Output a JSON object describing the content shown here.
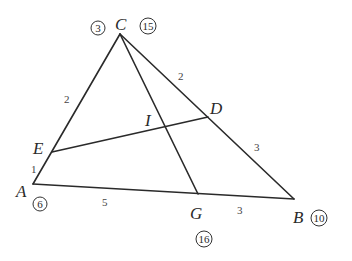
{
  "diagram": {
    "type": "geometry-triangle",
    "points": {
      "A": {
        "label": "A",
        "x": 33,
        "y": 184
      },
      "B": {
        "label": "B",
        "x": 294,
        "y": 199
      },
      "C": {
        "label": "C",
        "x": 120,
        "y": 34
      },
      "D": {
        "label": "D",
        "x": 208,
        "y": 117
      },
      "E": {
        "label": "E",
        "x": 52,
        "y": 152
      },
      "G": {
        "label": "G",
        "x": 198,
        "y": 194
      },
      "I": {
        "label": "I",
        "x": 166,
        "y": 126
      }
    },
    "segments": [
      {
        "from": "A",
        "to": "B"
      },
      {
        "from": "A",
        "to": "C"
      },
      {
        "from": "C",
        "to": "B"
      },
      {
        "from": "E",
        "to": "D"
      },
      {
        "from": "C",
        "to": "G"
      }
    ],
    "vertex_labels": {
      "C": "C",
      "D": "D",
      "I": "I",
      "E": "E",
      "A": "A",
      "G": "G",
      "B": "B"
    },
    "length_labels": {
      "CE": "2",
      "CD": "2",
      "EA": "1",
      "AG": "5",
      "DB": "3",
      "GB": "3"
    },
    "circled_numbers": {
      "C_left": "3",
      "C_right": "15",
      "A": "6",
      "B": "10",
      "G": "16"
    },
    "colors": {
      "line": "#2a2a2a",
      "background": "#ffffff"
    }
  }
}
